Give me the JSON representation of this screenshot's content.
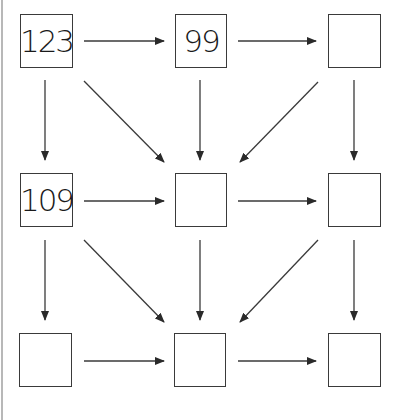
{
  "diagram": {
    "type": "number-grid-arrows",
    "colors": {
      "stroke": "#3a3a3a",
      "text": "#1a1a1a",
      "background": "#ffffff"
    },
    "cells": [
      {
        "id": "r1c1",
        "row": 1,
        "col": 1,
        "value": "123"
      },
      {
        "id": "r1c2",
        "row": 1,
        "col": 2,
        "value": "99"
      },
      {
        "id": "r1c3",
        "row": 1,
        "col": 3,
        "value": ""
      },
      {
        "id": "r2c1",
        "row": 2,
        "col": 1,
        "value": "109"
      },
      {
        "id": "r2c2",
        "row": 2,
        "col": 2,
        "value": ""
      },
      {
        "id": "r2c3",
        "row": 2,
        "col": 3,
        "value": ""
      },
      {
        "id": "r3c1",
        "row": 3,
        "col": 1,
        "value": ""
      },
      {
        "id": "r3c2",
        "row": 3,
        "col": 2,
        "value": ""
      },
      {
        "id": "r3c3",
        "row": 3,
        "col": 3,
        "value": ""
      }
    ],
    "arrows": [
      {
        "from": "r1c1",
        "to": "r1c2"
      },
      {
        "from": "r1c2",
        "to": "r1c3"
      },
      {
        "from": "r1c1",
        "to": "r2c1"
      },
      {
        "from": "r1c1",
        "to": "r2c2"
      },
      {
        "from": "r1c2",
        "to": "r2c2"
      },
      {
        "from": "r1c3",
        "to": "r2c2"
      },
      {
        "from": "r1c3",
        "to": "r2c3"
      },
      {
        "from": "r2c1",
        "to": "r2c2"
      },
      {
        "from": "r2c2",
        "to": "r2c3"
      },
      {
        "from": "r2c1",
        "to": "r3c1"
      },
      {
        "from": "r2c1",
        "to": "r3c2"
      },
      {
        "from": "r2c2",
        "to": "r3c2"
      },
      {
        "from": "r2c3",
        "to": "r3c2"
      },
      {
        "from": "r2c3",
        "to": "r3c3"
      },
      {
        "from": "r3c1",
        "to": "r3c2"
      },
      {
        "from": "r3c2",
        "to": "r3c3"
      }
    ]
  }
}
